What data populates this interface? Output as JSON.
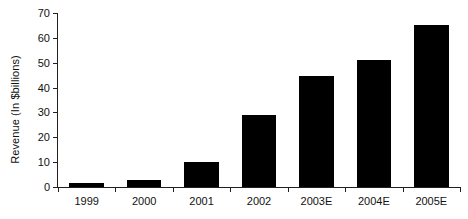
{
  "chart_data": {
    "type": "bar",
    "title": "",
    "subtitle": "",
    "xlabel": "",
    "ylabel": "Revenue (In $billions)",
    "categories": [
      "1999",
      "2000",
      "2001",
      "2002",
      "2003E",
      "2004E",
      "2005E"
    ],
    "values": [
      1.7,
      2.9,
      10,
      29,
      44.5,
      51,
      65
    ],
    "series": [
      {
        "name": "Revenue",
        "values": [
          1.7,
          2.9,
          10,
          29,
          44.5,
          51,
          65
        ],
        "color": "#000000"
      }
    ],
    "ylim": [
      0,
      70
    ],
    "ytick_values": [
      0,
      10,
      20,
      30,
      40,
      50,
      60,
      70
    ],
    "ytick_labels": [
      "0",
      "10",
      "20",
      "30",
      "40",
      "50",
      "60",
      "70"
    ],
    "xtick_labels": [
      "1999",
      "2000",
      "2001",
      "2002",
      "2003E",
      "2004E",
      "2005E"
    ],
    "grid": false,
    "legend": false,
    "legend_position": "none",
    "bar_color": "#000000",
    "axis_color": "#231f20",
    "background_color": "#ffffff"
  }
}
